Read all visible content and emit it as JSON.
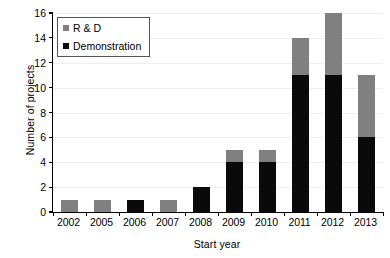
{
  "chart_data": {
    "type": "bar",
    "stacked": true,
    "title": "",
    "xlabel": "Start year",
    "ylabel": "Number of projects",
    "categories": [
      "2002",
      "2005",
      "2006",
      "2007",
      "2008",
      "2009",
      "2010",
      "2011",
      "2012",
      "2013"
    ],
    "series": [
      {
        "name": "Demonstration",
        "color": "#0a0a0a",
        "values": [
          0,
          0,
          1,
          0,
          2,
          4,
          4,
          11,
          11,
          6
        ]
      },
      {
        "name": "R & D",
        "color": "#808080",
        "values": [
          1,
          1,
          0,
          1,
          0,
          1,
          1,
          3,
          5,
          5
        ]
      }
    ],
    "totals": [
      1,
      1,
      1,
      1,
      2,
      5,
      5,
      14,
      16,
      11
    ],
    "ylim": [
      0,
      16
    ],
    "yticks": [
      0,
      2,
      4,
      6,
      8,
      10,
      12,
      14,
      16
    ],
    "ytick_labels": [
      "0",
      "2",
      "4",
      "6",
      "8",
      "10",
      "12",
      "14",
      "16"
    ],
    "grid": true,
    "legend_position": "top-left",
    "legend_entries": [
      "R & D",
      "Demonstration"
    ]
  }
}
